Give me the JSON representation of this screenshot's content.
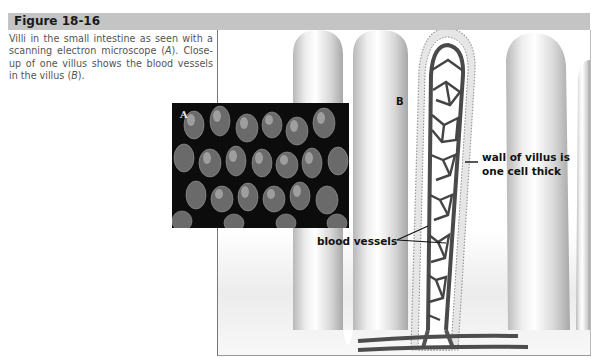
{
  "figure": {
    "number_label": "Figure 18-16",
    "caption_parts": {
      "part1": "Villi in the small intestine as seen with a scanning electron microscope (",
      "a": "A",
      "part2": "). Close-up of one villus shows the blood vessels in the villus (",
      "b": "B",
      "part3": ")."
    },
    "header_color": "#c4c4c4"
  },
  "illustration": {
    "panel_a_label": "A",
    "panel_b_label": "B",
    "callouts": {
      "wall_line1": "wall of villus is",
      "wall_line2": "one cell thick",
      "vessels": "blood vessels"
    }
  }
}
